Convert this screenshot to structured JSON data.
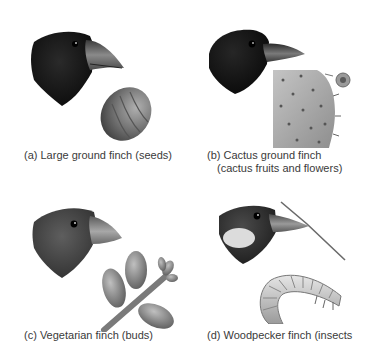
{
  "figure": {
    "panels": [
      {
        "id": "a",
        "caption_lines": [
          "(a) Large ground finch (seeds)"
        ],
        "bird": "large-ground-finch",
        "food": "seed"
      },
      {
        "id": "b",
        "caption_lines": [
          "(b) Cactus ground finch",
          "(cactus fruits and flowers)"
        ],
        "bird": "cactus-ground-finch",
        "food": "cactus-pad"
      },
      {
        "id": "c",
        "caption_lines": [
          "(c) Vegetarian finch (buds)"
        ],
        "bird": "vegetarian-finch",
        "food": "buds-on-twig"
      },
      {
        "id": "d",
        "caption_lines": [
          "(d) Woodpecker finch (insects"
        ],
        "bird": "woodpecker-finch",
        "food": "insect-larva"
      }
    ],
    "colors": {
      "background": "#ffffff",
      "caption_text": "#3a3a3a",
      "dark_plumage": "#141414",
      "grey_plumage": "#5a5a5a",
      "beak": "#6e6e6e",
      "seed": "#7a7a7a",
      "cactus": "#a9a9a9",
      "bud": "#8c8c8c",
      "larva": "#c8c8c8"
    }
  }
}
